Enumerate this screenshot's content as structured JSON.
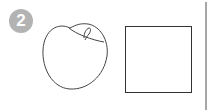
{
  "step": {
    "number": "2",
    "badge_color": "#b3b3b3"
  },
  "illustration": {
    "shapes": [
      "apple-outline",
      "square-outline",
      "vertical-divider"
    ],
    "stroke_color": "#444444",
    "divider_color": "#888888"
  }
}
